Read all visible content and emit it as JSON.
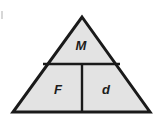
{
  "figure": {
    "kind": "formula-triangle",
    "background_color": "#ffffff",
    "fill_color": "#e3e3e3",
    "stroke_color": "#1a1a1a",
    "label_color": "#1c1c1c",
    "stroke_width": 3,
    "divider_width": 2,
    "geometry": {
      "apex": {
        "x": 82,
        "y": 17
      },
      "left_vertex": {
        "x": 13,
        "y": 112
      },
      "right_vertex": {
        "x": 150,
        "y": 112
      },
      "horizontal_divider": {
        "x1": 43,
        "y1": 64,
        "x2": 120,
        "y2": 64
      },
      "vertical_divider": {
        "x1": 82,
        "y1": 64,
        "x2": 82,
        "y2": 112
      }
    },
    "cells": [
      {
        "name": "top",
        "label": "M",
        "cx": 81,
        "cy": 47
      },
      {
        "name": "bottom-left",
        "label": "F",
        "cx": 58,
        "cy": 91
      },
      {
        "name": "bottom-right",
        "label": "d",
        "cx": 106,
        "cy": 91
      }
    ]
  }
}
